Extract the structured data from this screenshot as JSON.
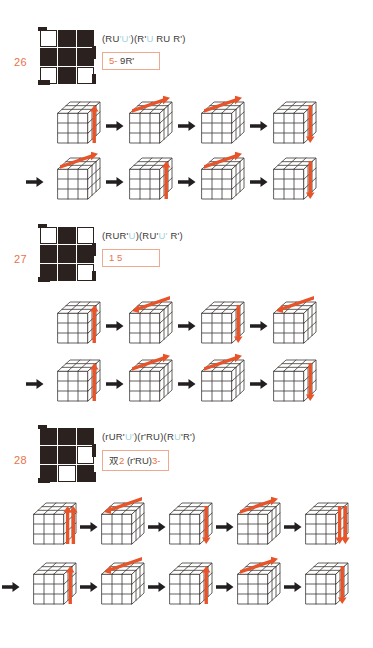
{
  "page": {
    "accent_orange": "#e8734a",
    "box_border": "#f0a88e",
    "cube_line": "#3d3936",
    "arrow_color": "#e8542a",
    "sep_arrow_color": "#231f20",
    "pattern_dark": "#2b211e"
  },
  "entries": [
    {
      "number": "26",
      "pattern": [
        "w",
        "d",
        "d",
        "d",
        "d",
        "d",
        "w",
        "d",
        "w"
      ],
      "formula_parts": [
        {
          "t": "(RU",
          "hl": false
        },
        {
          "t": "'U'",
          "hl": true
        },
        {
          "t": ")(R'",
          "hl": false
        },
        {
          "t": "U",
          "hl": true
        },
        {
          "t": " RU",
          "hl": false
        },
        {
          "t": " ",
          "hl": true
        },
        {
          "t": "R')",
          "hl": false
        }
      ],
      "formula_plain": "(RU'U')(R'U RU R')",
      "note_parts": [
        {
          "t": "5-",
          "c": "or"
        },
        {
          "t": "   9R'",
          "c": "dk"
        }
      ],
      "note_plain": "5-   9R'",
      "cube_count": 4,
      "rows": [
        {
          "lead_arrow": false,
          "cubes": [
            {
              "dir": "up",
              "face": "right",
              "double": false
            },
            {
              "dir": "right",
              "face": "top",
              "double": false
            },
            {
              "dir": "right",
              "face": "top",
              "double": false
            },
            {
              "dir": "down",
              "face": "right",
              "double": false
            }
          ]
        },
        {
          "lead_arrow": true,
          "cubes": [
            {
              "dir": "right",
              "face": "top",
              "double": false
            },
            {
              "dir": "up",
              "face": "right",
              "double": false
            },
            {
              "dir": "right",
              "face": "top",
              "double": false
            },
            {
              "dir": "down",
              "face": "right",
              "double": false
            }
          ]
        }
      ]
    },
    {
      "number": "27",
      "pattern": [
        "w",
        "d",
        "w",
        "d",
        "d",
        "d",
        "d",
        "d",
        "w"
      ],
      "formula_parts": [
        {
          "t": "(RUR'",
          "hl": false
        },
        {
          "t": "U",
          "hl": true
        },
        {
          "t": ")(RU'",
          "hl": false
        },
        {
          "t": "U'",
          "hl": true
        },
        {
          "t": " R')",
          "hl": false
        }
      ],
      "formula_plain": "(RUR'U)(RU'U' R')",
      "note_parts": [
        {
          "t": "1",
          "c": "or"
        },
        {
          "t": "   5",
          "c": "or"
        }
      ],
      "note_plain": "1   5",
      "cube_count": 4,
      "rows": [
        {
          "lead_arrow": false,
          "cubes": [
            {
              "dir": "up",
              "face": "right",
              "double": false
            },
            {
              "dir": "left",
              "face": "top",
              "double": false
            },
            {
              "dir": "down",
              "face": "right",
              "double": false
            },
            {
              "dir": "left",
              "face": "top",
              "double": false
            }
          ]
        },
        {
          "lead_arrow": true,
          "cubes": [
            {
              "dir": "up",
              "face": "right",
              "double": false
            },
            {
              "dir": "right",
              "face": "top",
              "double": false
            },
            {
              "dir": "right",
              "face": "top",
              "double": false
            },
            {
              "dir": "down",
              "face": "right",
              "double": false
            }
          ]
        }
      ]
    },
    {
      "number": "28",
      "pattern": [
        "d",
        "d",
        "d",
        "d",
        "d",
        "w",
        "d",
        "w",
        "d"
      ],
      "formula_parts": [
        {
          "t": "(rUR'",
          "hl": false
        },
        {
          "t": "U'",
          "hl": true
        },
        {
          "t": ")(r'RU)(R",
          "hl": false
        },
        {
          "t": "U",
          "hl": true
        },
        {
          "t": "'R')",
          "hl": false
        }
      ],
      "formula_plain": "(rUR'U')(r'RU)(RU'R')",
      "note_parts": [
        {
          "t": "双",
          "c": "cjk"
        },
        {
          "t": "2",
          "c": "or"
        },
        {
          "t": "   (r'RU)",
          "c": "dk"
        },
        {
          "t": "3-",
          "c": "or"
        }
      ],
      "note_plain": "双2   (r'RU)3-",
      "cube_count": 5,
      "rows": [
        {
          "lead_arrow": false,
          "cubes": [
            {
              "dir": "up",
              "face": "right",
              "double": true
            },
            {
              "dir": "left",
              "face": "top",
              "double": false
            },
            {
              "dir": "down",
              "face": "right",
              "double": false
            },
            {
              "dir": "right",
              "face": "top",
              "double": false
            },
            {
              "dir": "down",
              "face": "right",
              "double": true
            }
          ]
        },
        {
          "lead_arrow": true,
          "cubes": [
            {
              "dir": "up",
              "face": "right",
              "double": false
            },
            {
              "dir": "left",
              "face": "top",
              "double": false
            },
            {
              "dir": "up",
              "face": "right",
              "double": false
            },
            {
              "dir": "right",
              "face": "top",
              "double": false
            },
            {
              "dir": "down",
              "face": "right",
              "double": false
            }
          ]
        }
      ]
    }
  ]
}
